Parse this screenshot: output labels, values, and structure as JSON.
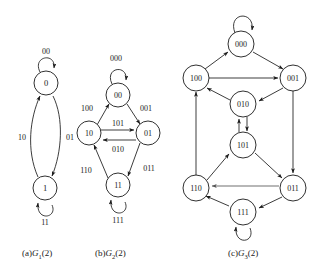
{
  "figure": {
    "background_color": "#ffffff",
    "stroke_color": "#1a1a1a",
    "panels": [
      {
        "id": "panel-a",
        "caption_prefix": "(a)",
        "caption_name": "G",
        "caption_sub": "1",
        "caption_suffix": "(2)",
        "caption_full": "(a)G1(2)",
        "nodes": [
          {
            "id": "0",
            "label": "0",
            "cx": 46,
            "cy": 83,
            "r": 12
          },
          {
            "id": "1",
            "label": "1",
            "cx": 45,
            "cy": 188,
            "r": 12
          }
        ],
        "edges": [
          {
            "from": "0",
            "to": "0",
            "label": "00",
            "kind": "self-loop",
            "label_x": 46,
            "label_y": 51
          },
          {
            "from": "1",
            "to": "1",
            "label": "11",
            "kind": "self-loop",
            "label_x": 45,
            "label_y": 222
          },
          {
            "from": "1",
            "to": "0",
            "label": "10",
            "kind": "curve",
            "label_x": 22,
            "label_y": 137
          },
          {
            "from": "0",
            "to": "1",
            "label": "01",
            "kind": "curve",
            "label_x": 70,
            "label_y": 137
          }
        ]
      },
      {
        "id": "panel-b",
        "caption_prefix": "(b)",
        "caption_name": "G",
        "caption_sub": "2",
        "caption_suffix": "(2)",
        "caption_full": "(b)G2(2)",
        "nodes": [
          {
            "id": "00",
            "label": "00",
            "cx": 118,
            "cy": 95,
            "r": 12
          },
          {
            "id": "10",
            "label": "10",
            "cx": 89,
            "cy": 133,
            "r": 12
          },
          {
            "id": "01",
            "label": "01",
            "cx": 148,
            "cy": 133,
            "r": 12
          },
          {
            "id": "11",
            "label": "11",
            "cx": 118,
            "cy": 185,
            "r": 12
          }
        ],
        "edges": [
          {
            "from": "00",
            "to": "00",
            "label": "000",
            "kind": "self-loop",
            "label_x": 116,
            "label_y": 58
          },
          {
            "from": "11",
            "to": "11",
            "label": "111",
            "kind": "self-loop",
            "label_x": 118,
            "label_y": 220
          },
          {
            "from": "00",
            "to": "01",
            "label": "001",
            "kind": "straight",
            "label_x": 146,
            "label_y": 108
          },
          {
            "from": "10",
            "to": "01",
            "label": "101",
            "kind": "straight",
            "label_x": 118,
            "label_y": 124
          },
          {
            "from": "01",
            "to": "10",
            "label": "010",
            "kind": "straight",
            "label_x": 118,
            "label_y": 148
          },
          {
            "from": "01",
            "to": "11",
            "label": "011",
            "kind": "straight",
            "label_x": 148,
            "label_y": 168
          },
          {
            "from": "10",
            "to": "00",
            "label": "100",
            "kind": "straight",
            "label_x": 88,
            "label_y": 108
          },
          {
            "from": "11",
            "to": "10",
            "label": "110",
            "kind": "straight",
            "label_x": 88,
            "label_y": 170
          }
        ]
      },
      {
        "id": "panel-c",
        "caption_prefix": "(c)",
        "caption_name": "G",
        "caption_sub": "3",
        "caption_suffix": "(2)",
        "caption_full": "(c)G3(2)",
        "nodes": [
          {
            "id": "000",
            "label": "000",
            "cx": 241,
            "cy": 44,
            "r": 13
          },
          {
            "id": "100",
            "label": "100",
            "cx": 196,
            "cy": 78,
            "r": 13
          },
          {
            "id": "001",
            "label": "001",
            "cx": 293,
            "cy": 78,
            "r": 13
          },
          {
            "id": "010",
            "label": "010",
            "cx": 243,
            "cy": 104,
            "r": 13
          },
          {
            "id": "101",
            "label": "101",
            "cx": 243,
            "cy": 145,
            "r": 13
          },
          {
            "id": "110",
            "label": "110",
            "cx": 196,
            "cy": 188,
            "r": 13
          },
          {
            "id": "011",
            "label": "011",
            "cx": 293,
            "cy": 188,
            "r": 13
          },
          {
            "id": "111",
            "label": "111",
            "cx": 243,
            "cy": 212,
            "r": 13
          }
        ],
        "edges": [
          {
            "from": "000",
            "to": "000",
            "kind": "self-loop"
          },
          {
            "from": "111",
            "to": "111",
            "kind": "self-loop"
          },
          {
            "from": "000",
            "to": "001",
            "kind": "straight"
          },
          {
            "from": "100",
            "to": "000",
            "kind": "straight"
          },
          {
            "from": "100",
            "to": "001",
            "kind": "straight"
          },
          {
            "from": "001",
            "to": "010",
            "kind": "straight"
          },
          {
            "from": "001",
            "to": "011",
            "kind": "straight"
          },
          {
            "from": "010",
            "to": "100",
            "kind": "straight"
          },
          {
            "from": "010",
            "to": "101",
            "kind": "straight"
          },
          {
            "from": "101",
            "to": "010",
            "kind": "straight"
          },
          {
            "from": "101",
            "to": "011",
            "kind": "straight"
          },
          {
            "from": "110",
            "to": "101",
            "kind": "straight"
          },
          {
            "from": "110",
            "to": "100",
            "kind": "straight"
          },
          {
            "from": "011",
            "to": "110",
            "kind": "straight"
          },
          {
            "from": "011",
            "to": "111",
            "kind": "straight"
          },
          {
            "from": "111",
            "to": "110",
            "kind": "straight"
          }
        ]
      }
    ]
  }
}
